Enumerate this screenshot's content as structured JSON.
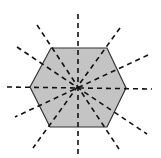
{
  "diagram": {
    "title": "Regular hexagon with lines of symmetry",
    "shape": "regular-hexagon",
    "fill_color": "#c4c4c4",
    "stroke_color": "#333333",
    "line_color": "#111111",
    "center": [
      78,
      88
    ],
    "vertices": [
      [
        30,
        87
      ],
      [
        51,
        48
      ],
      [
        107,
        48
      ],
      [
        126,
        88
      ],
      [
        107,
        127
      ],
      [
        50,
        127
      ]
    ],
    "symmetry_lines_count": 6,
    "symmetry_lines": [
      {
        "type": "vertical",
        "from": [
          78,
          14
        ],
        "to": [
          78,
          156
        ]
      },
      {
        "type": "horizontal",
        "from": [
          7,
          87
        ],
        "to": [
          152,
          89
        ]
      },
      {
        "type": "edge-midpoint",
        "from": [
          37,
          25
        ],
        "to": [
          119,
          149
        ]
      },
      {
        "type": "edge-midpoint",
        "from": [
          120,
          28
        ],
        "to": [
          33,
          148
        ]
      },
      {
        "type": "vertex",
        "from": [
          17,
          47
        ],
        "to": [
          147,
          134
        ]
      },
      {
        "type": "vertex",
        "from": [
          148,
          55
        ],
        "to": [
          15,
          117
        ]
      }
    ]
  }
}
